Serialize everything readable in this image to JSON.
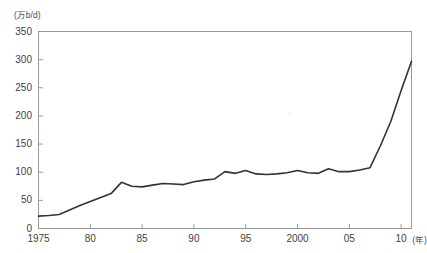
{
  "chart_data": {
    "type": "line",
    "title": "",
    "subtitle": "",
    "xlabel": "(年)",
    "ylabel": "(万b/d)",
    "unit_label": "(万b/d)",
    "xlim": [
      1975,
      2011
    ],
    "ylim": [
      0,
      350
    ],
    "ytick_values": [
      0,
      50,
      100,
      150,
      200,
      250,
      300,
      350
    ],
    "ytick_labels": [
      "0",
      "50",
      "100",
      "150",
      "200",
      "250",
      "300",
      "350"
    ],
    "xtick_values": [
      1975,
      1980,
      1985,
      1990,
      1995,
      2000,
      2005,
      2010
    ],
    "xtick_labels": [
      "1975",
      "80",
      "85",
      "90",
      "95",
      "2000",
      "05",
      "10"
    ],
    "grid": false,
    "legend": null,
    "legend_position": "none",
    "line_color": "#333333",
    "frame_color": "#9a9a9a",
    "x": [
      1975,
      1976,
      1977,
      1978,
      1979,
      1980,
      1981,
      1982,
      1983,
      1984,
      1985,
      1986,
      1987,
      1988,
      1989,
      1990,
      1991,
      1992,
      1993,
      1994,
      1995,
      1996,
      1997,
      1998,
      1999,
      2000,
      2001,
      2002,
      2003,
      2004,
      2005,
      2006,
      2007,
      2008,
      2009,
      2010,
      2011
    ],
    "values": [
      22,
      23,
      25,
      33,
      41,
      48,
      55,
      62,
      82,
      75,
      74,
      77,
      80,
      79,
      78,
      83,
      86,
      88,
      101,
      98,
      103,
      97,
      96,
      97,
      99,
      103,
      99,
      98,
      106,
      101,
      101,
      104,
      108,
      147,
      190,
      245,
      297
    ],
    "series": [
      {
        "name": "原油消費量",
        "values": [
          22,
          23,
          25,
          33,
          41,
          48,
          55,
          62,
          82,
          75,
          74,
          77,
          80,
          79,
          78,
          83,
          86,
          88,
          101,
          98,
          103,
          97,
          96,
          97,
          99,
          103,
          99,
          98,
          106,
          101,
          101,
          104,
          108,
          147,
          190,
          245,
          297
        ]
      }
    ],
    "annotations": []
  },
  "axes": {
    "y_unit_note": "(万b/d)",
    "x_unit_note": "(年)"
  }
}
